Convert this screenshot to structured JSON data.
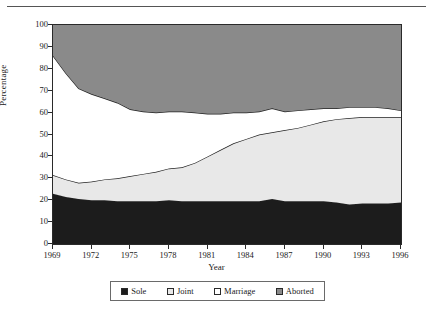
{
  "chart_data": {
    "type": "area",
    "title": "",
    "xlabel": "Year",
    "ylabel": "Percentage",
    "xlim": [
      1969,
      1996
    ],
    "ylim": [
      0,
      100
    ],
    "grid": false,
    "stacked": true,
    "legend_position": "bottom",
    "xticks": [
      1969,
      1972,
      1975,
      1978,
      1981,
      1984,
      1987,
      1990,
      1993,
      1996
    ],
    "xtick_labels": [
      "1969",
      "1972",
      "1975",
      "1978",
      "1981",
      "1984",
      "1987",
      "1990",
      "1993",
      "1996"
    ],
    "yticks": [
      0,
      10,
      20,
      30,
      40,
      50,
      60,
      70,
      80,
      90,
      100
    ],
    "ytick_labels": [
      "0",
      "10",
      "20",
      "30",
      "40",
      "50",
      "60",
      "70",
      "80",
      "90",
      "100"
    ],
    "x": [
      1969,
      1970,
      1971,
      1972,
      1973,
      1974,
      1975,
      1976,
      1977,
      1978,
      1979,
      1980,
      1981,
      1982,
      1983,
      1984,
      1985,
      1986,
      1987,
      1988,
      1989,
      1990,
      1991,
      1992,
      1993,
      1994,
      1995,
      1996
    ],
    "series": [
      {
        "name": "Sole",
        "color": "#1c1c1c",
        "values": [
          23,
          21.5,
          20.5,
          20,
          20,
          19.5,
          19.5,
          19.5,
          19.5,
          20,
          19.5,
          19.5,
          19.5,
          19.5,
          19.5,
          19.5,
          19.5,
          20.5,
          19.5,
          19.5,
          19.5,
          19.5,
          19,
          18,
          18.5,
          18.5,
          18.5,
          19
        ]
      },
      {
        "name": "Joint",
        "color": "#e8e8e8",
        "values": [
          8.5,
          8,
          7.5,
          8.5,
          9.5,
          10.5,
          11.5,
          12.5,
          13.5,
          14.5,
          15.5,
          17.5,
          20.5,
          23.5,
          26.5,
          28.5,
          30.5,
          30.5,
          32.5,
          33.5,
          35,
          36.5,
          38,
          39.5,
          39.5,
          39.5,
          39.5,
          39
        ]
      },
      {
        "name": "Marriage",
        "color": "#ffffff",
        "values": [
          54.5,
          48.5,
          43,
          40,
          37,
          34.5,
          30.5,
          28.5,
          27,
          26,
          25.5,
          23,
          19.5,
          16.5,
          14,
          12,
          10.5,
          11,
          8.5,
          8,
          7,
          6,
          5,
          5,
          4.5,
          4.5,
          4,
          3
        ]
      },
      {
        "name": "Aborted",
        "color": "#8a8a8a",
        "values": [
          14,
          22,
          29,
          31.5,
          33.5,
          35.5,
          38.5,
          39.5,
          40,
          39.5,
          39.5,
          40,
          40.5,
          40.5,
          40,
          40,
          39.5,
          38,
          39.5,
          39,
          38.5,
          38,
          38,
          37.5,
          37.5,
          37.5,
          38,
          39
        ]
      }
    ],
    "boundaries": {
      "comment": "cumulative stacked upper edges in percent",
      "sole_top": [
        23,
        21.5,
        20.5,
        20,
        20,
        19.5,
        19.5,
        19.5,
        19.5,
        20,
        19.5,
        19.5,
        19.5,
        19.5,
        19.5,
        19.5,
        19.5,
        20.5,
        19.5,
        19.5,
        19.5,
        19.5,
        19,
        18,
        18.5,
        18.5,
        18.5,
        19
      ],
      "joint_top": [
        31.5,
        29.5,
        28,
        28.5,
        29.5,
        30,
        31,
        32,
        33,
        34.5,
        35,
        37,
        40,
        43,
        46,
        48,
        50,
        51,
        52,
        53,
        54.5,
        56,
        57,
        57.5,
        58,
        58,
        58,
        58
      ],
      "marriage_top": [
        86,
        78,
        71,
        68.5,
        66.5,
        64.5,
        61.5,
        60.5,
        60,
        60.5,
        60.5,
        60,
        59.5,
        59.5,
        60,
        60,
        60.5,
        62,
        60.5,
        61,
        61.5,
        62,
        62,
        62.5,
        62.5,
        62.5,
        62,
        61
      ]
    },
    "legend": [
      {
        "label": "Sole",
        "color": "#1c1c1c"
      },
      {
        "label": "Joint",
        "color": "#e8e8e8"
      },
      {
        "label": "Marriage",
        "color": "#ffffff"
      },
      {
        "label": "Aborted",
        "color": "#8a8a8a"
      }
    ]
  }
}
